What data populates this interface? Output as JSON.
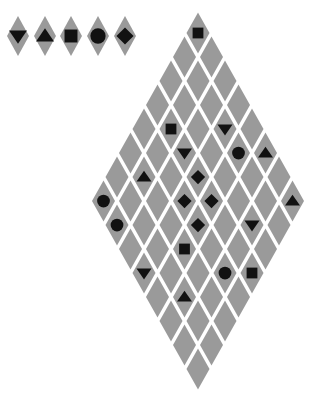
{
  "colors": {
    "cell": "#9a9a9a",
    "gap": "#ffffff",
    "piece": "#111111"
  },
  "palette": {
    "items": [
      {
        "shape": "triangle-down",
        "x": 18,
        "y": 36
      },
      {
        "shape": "triangle-up",
        "x": 45,
        "y": 36
      },
      {
        "shape": "square",
        "x": 71,
        "y": 36
      },
      {
        "shape": "circle",
        "x": 98,
        "y": 36
      },
      {
        "shape": "diamond",
        "x": 125,
        "y": 36
      }
    ]
  },
  "board": {
    "size": 8,
    "origin_x": 198,
    "origin_y": 33,
    "step_x": 13.5,
    "step_y": 24,
    "pieces": [
      {
        "r": 0,
        "c": 0,
        "shape": "square"
      },
      {
        "r": 3,
        "c": 1,
        "shape": "square"
      },
      {
        "r": 1,
        "c": 3,
        "shape": "triangle-down"
      },
      {
        "r": 3,
        "c": 2,
        "shape": "triangle-down"
      },
      {
        "r": 1,
        "c": 4,
        "shape": "circle"
      },
      {
        "r": 0,
        "c": 5,
        "shape": "triangle-up"
      },
      {
        "r": 5,
        "c": 1,
        "shape": "triangle-up"
      },
      {
        "r": 3,
        "c": 3,
        "shape": "diamond"
      },
      {
        "r": 4,
        "c": 3,
        "shape": "diamond"
      },
      {
        "r": 3,
        "c": 4,
        "shape": "diamond"
      },
      {
        "r": 4,
        "c": 4,
        "shape": "diamond"
      },
      {
        "r": 2,
        "c": 6,
        "shape": "triangle-down"
      },
      {
        "r": 5,
        "c": 4,
        "shape": "square"
      },
      {
        "r": 7,
        "c": 0,
        "shape": "circle"
      },
      {
        "r": 7,
        "c": 1,
        "shape": "circle"
      },
      {
        "r": 0,
        "c": 7,
        "shape": "triangle-up"
      },
      {
        "r": 7,
        "c": 3,
        "shape": "triangle-down"
      },
      {
        "r": 4,
        "c": 6,
        "shape": "circle"
      },
      {
        "r": 3,
        "c": 7,
        "shape": "square"
      },
      {
        "r": 6,
        "c": 5,
        "shape": "triangle-up"
      }
    ]
  }
}
